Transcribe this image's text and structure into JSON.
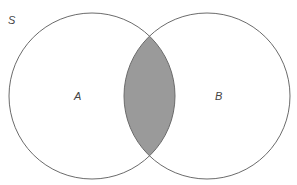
{
  "diagram": {
    "type": "venn",
    "universe_label": "S",
    "sets": [
      {
        "label": "A",
        "cx": 92,
        "cy": 96,
        "r": 83
      },
      {
        "label": "B",
        "cx": 207,
        "cy": 96,
        "r": 83
      }
    ],
    "shaded_region": "A ∩ B",
    "colors": {
      "stroke": "#6b6b6b",
      "shade": "#9a9a9a",
      "background": "#ffffff"
    }
  }
}
